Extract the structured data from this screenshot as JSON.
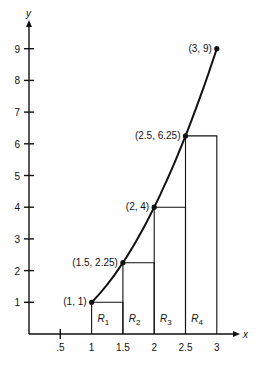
{
  "chart_data": {
    "type": "line",
    "title": "",
    "xlabel": "x",
    "ylabel": "y",
    "xlim": [
      0,
      3
    ],
    "ylim": [
      0,
      9.5
    ],
    "x_ticks": [
      ".5",
      "1",
      "1.5",
      "2",
      "2.5",
      "3"
    ],
    "y_ticks": [
      "1",
      "2",
      "3",
      "4",
      "5",
      "6",
      "7",
      "8",
      "9"
    ],
    "curve": "y = x^2",
    "points": [
      {
        "x": 1,
        "y": 1,
        "label": "(1, 1)"
      },
      {
        "x": 1.5,
        "y": 2.25,
        "label": "(1.5, 2.25)"
      },
      {
        "x": 2,
        "y": 4,
        "label": "(2, 4)"
      },
      {
        "x": 2.5,
        "y": 6.25,
        "label": "(2.5, 6.25)"
      },
      {
        "x": 3,
        "y": 9,
        "label": "(3, 9)"
      }
    ],
    "rectangles": [
      {
        "label": "R",
        "sub": "1",
        "x0": 1,
        "x1": 1.5,
        "height": 1
      },
      {
        "label": "R",
        "sub": "2",
        "x0": 1.5,
        "x1": 2,
        "height": 2.25
      },
      {
        "label": "R",
        "sub": "3",
        "x0": 2,
        "x1": 2.5,
        "height": 4
      },
      {
        "label": "R",
        "sub": "4",
        "x0": 2.5,
        "x1": 3,
        "height": 6.25
      }
    ],
    "grid": false
  }
}
